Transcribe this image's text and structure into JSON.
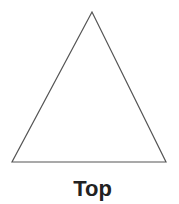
{
  "diagram": {
    "shape": "triangle",
    "vertices": [
      [
        92,
        12
      ],
      [
        12,
        162
      ],
      [
        166,
        162
      ]
    ],
    "stroke_color": "#555555",
    "fill_color": "#ffffff",
    "label": "Top"
  }
}
